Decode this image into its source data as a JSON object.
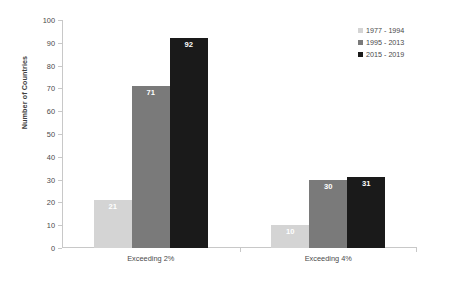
{
  "chart_data": {
    "type": "bar",
    "title": "",
    "xlabel": "",
    "ylabel": "Number of Countries",
    "ylim": [
      0,
      100
    ],
    "ytick_step": 10,
    "yticks": [
      0,
      10,
      20,
      30,
      40,
      50,
      60,
      70,
      80,
      90,
      100
    ],
    "grid": false,
    "legend_position": "top-right",
    "categories": [
      "Exceeding 2%",
      "Exceeding 4%"
    ],
    "series": [
      {
        "name": "1977 - 1994",
        "values": [
          21,
          10
        ],
        "color": "#d4d4d4"
      },
      {
        "name": "1995 - 2013",
        "values": [
          71,
          30
        ],
        "color": "#7a7a7a"
      },
      {
        "name": "2015 - 2019",
        "values": [
          92,
          31
        ],
        "color": "#1a1a1a"
      }
    ],
    "data_labels": [
      "21",
      "71",
      "92",
      "10",
      "30",
      "31"
    ],
    "axis_color": "#c8c8c8",
    "label_color": "#4a4a4a",
    "data_label_color": "#ffffff",
    "background": "#ffffff"
  }
}
